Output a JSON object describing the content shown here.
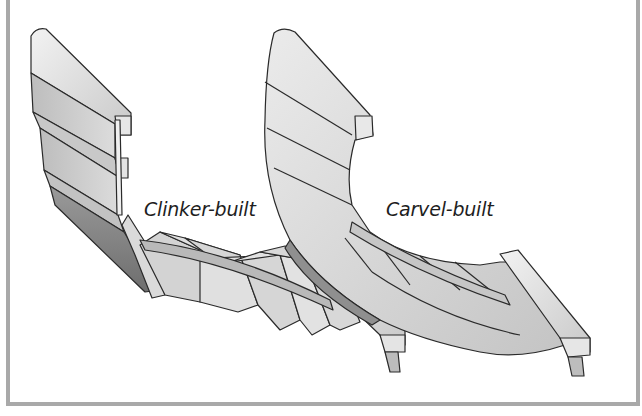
{
  "figure": {
    "labels": {
      "clinker": "Clinker-built",
      "carvel": "Carvel-built"
    },
    "colors": {
      "frame_border": "#a9a9a9",
      "plank_light": "#e8e8e8",
      "plank_mid": "#cfcfcf",
      "plank_dark": "#8c8c8c",
      "outline": "#2a2a2a",
      "background": "#ffffff"
    }
  }
}
